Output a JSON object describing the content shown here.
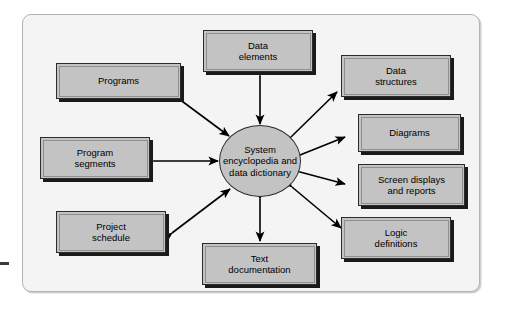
{
  "diagram": {
    "frame": {
      "background_color": "#f4f4f4",
      "border_color": "#b4b4b4"
    },
    "hub": {
      "label_lines": [
        "System",
        "encyclopedia",
        "and data",
        "dictionary"
      ],
      "line1": "System",
      "line2": "encyclopedia",
      "line3": "and data",
      "line4": "dictionary",
      "shape": "ellipse",
      "fill_color": "#c3c3c3",
      "border_color": "#2b2b2b"
    },
    "node_style": {
      "fill_color": "#c3c3c3",
      "border_color": "#2b2b2b",
      "shadow_color": "#1a1a1a"
    },
    "nodes": [
      {
        "id": "programs",
        "line1": "Programs",
        "line2": "",
        "side": "left"
      },
      {
        "id": "program-segments",
        "line1": "Program",
        "line2": "segments",
        "side": "left"
      },
      {
        "id": "project-schedule",
        "line1": "Project",
        "line2": "schedule",
        "side": "left"
      },
      {
        "id": "data-elements",
        "line1": "Data",
        "line2": "elements",
        "side": "top"
      },
      {
        "id": "text-documentation",
        "line1": "Text",
        "line2": "documentation",
        "side": "bottom"
      },
      {
        "id": "data-structures",
        "line1": "Data",
        "line2": "structures",
        "side": "right"
      },
      {
        "id": "diagrams",
        "line1": "Diagrams",
        "line2": "",
        "side": "right"
      },
      {
        "id": "screen-displays",
        "line1": "Screen displays",
        "line2": "and reports",
        "side": "right"
      },
      {
        "id": "logic-definitions",
        "line1": "Logic",
        "line2": "definitions",
        "side": "right"
      }
    ],
    "connectors": {
      "style": "double-headed-arrow",
      "color": "#000000",
      "count": 9
    }
  }
}
